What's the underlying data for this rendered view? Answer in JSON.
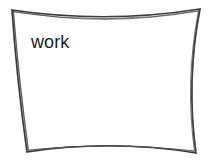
{
  "canvas": {
    "width": 212,
    "height": 166,
    "background_color": "#ffffff"
  },
  "diagram": {
    "type": "sketch-box",
    "node": {
      "label": "work",
      "label_color": "#1b1b1b",
      "label_font_size_px": 18,
      "label_position": {
        "x": 31,
        "y": 33
      },
      "shape": {
        "name": "hand-drawn-concave-rectangle",
        "stroke_color": "#3a3a3a",
        "stroke_color_secondary": "#4d4d4d",
        "stroke_width_px": 1.6,
        "fill": "none",
        "style": "sketchy-double-line",
        "corners": {
          "top_left": {
            "x": 12,
            "y": 10
          },
          "top_right": {
            "x": 200,
            "y": 9
          },
          "bottom_right": {
            "x": 196,
            "y": 153
          },
          "bottom_left": {
            "x": 27,
            "y": 152
          }
        },
        "edge_midpoints": {
          "top": {
            "x": 106,
            "y": 20
          },
          "right": {
            "x": 188,
            "y": 81
          },
          "bottom": {
            "x": 111,
            "y": 143
          },
          "left": {
            "x": 21,
            "y": 81
          }
        },
        "paths": {
          "outline_primary": "M 12 10 Q 106 24 200 9 Q 186 81 196 153 Q 111 139 27 152 Q 17 81 12 10 Z",
          "outline_secondary": "M 13.5 11.5 Q 106 27 198.5 11 Q 185 81 194.5 151 Q 111 141.5 28.5 150 Q 19 81 13.5 11.5 Z",
          "accent_top": "M 14 12 Q 106 26 198 11",
          "accent_bottom": "M 29 150.5 Q 111 140.5 194 151.5",
          "accent_left": "M 13 11 Q 18.5 81 28 151",
          "accent_right": "M 199 10 Q 186.5 81 195.5 152"
        }
      }
    }
  }
}
